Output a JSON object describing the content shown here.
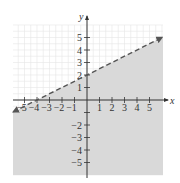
{
  "chart_data": {
    "type": "area",
    "title": "",
    "xlabel": "x",
    "ylabel": "y",
    "xlim": [
      -6,
      6
    ],
    "ylim": [
      -6,
      6
    ],
    "grid": true,
    "x_ticks": [
      -5,
      -4,
      -3,
      -2,
      -1,
      1,
      2,
      3,
      4,
      5
    ],
    "y_ticks": [
      5,
      4,
      3,
      2,
      1,
      -2,
      -3,
      -4,
      -5
    ],
    "x_tick_labels": [
      "−5",
      "−4",
      "−3",
      "−2",
      "−1",
      "1",
      "2",
      "3",
      "4",
      "5"
    ],
    "y_tick_labels": [
      "5",
      "4",
      "3",
      "2",
      "1",
      "−2",
      "−3",
      "−4",
      "−5"
    ],
    "series": [
      {
        "name": "boundary line",
        "equation": "y = x/2 + 2",
        "slope": 0.5,
        "intercept": 2,
        "style": "dashed",
        "points": [
          [
            -6,
            -1
          ],
          [
            -4,
            0
          ],
          [
            0,
            2
          ],
          [
            6,
            5
          ]
        ]
      }
    ],
    "shaded_region": {
      "description": "below the dashed line",
      "inequality": "y < x/2 + 2"
    }
  },
  "colors": {
    "shade": "#d9d9d9",
    "grid": "#e6e6e6",
    "axis": "#333333",
    "line": "#555555"
  }
}
